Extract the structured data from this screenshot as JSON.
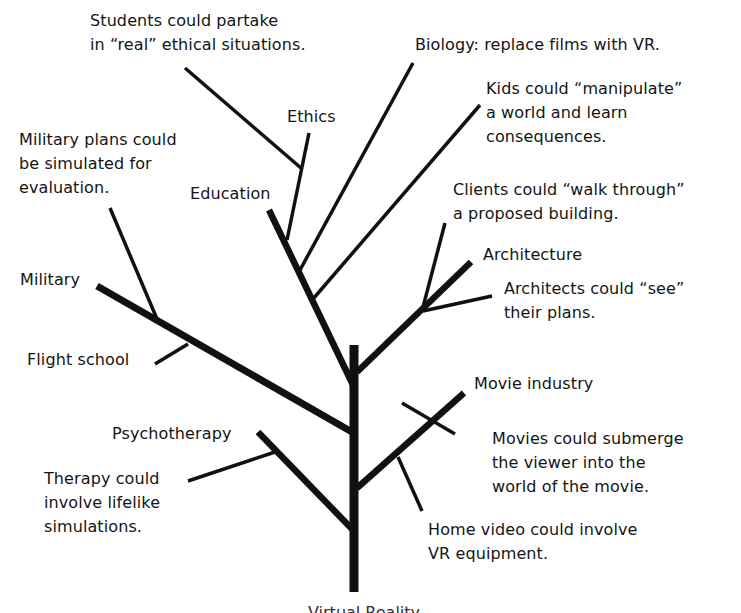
{
  "diagram": {
    "type": "concept-tree",
    "root": {
      "label": "Virtual Reality",
      "note": "root label partially cropped at bottom edge"
    },
    "branches": [
      {
        "id": "military",
        "label": "Military",
        "ideas": [
          "Military plans could\nbe simulated for\nevaluation.",
          "Flight school"
        ]
      },
      {
        "id": "education",
        "label": "Education",
        "ideas": [
          "Students could partake\nin “real” ethical situations.",
          "Biology: replace films with VR.",
          "Kids could “manipulate”\na world and learn\nconsequences."
        ],
        "sub_branches": [
          {
            "id": "ethics",
            "label": "Ethics"
          }
        ]
      },
      {
        "id": "architecture",
        "label": "Architecture",
        "ideas": [
          "Clients could “walk through”\na proposed building.",
          "Architects could “see”\ntheir plans."
        ]
      },
      {
        "id": "movie",
        "label": "Movie industry",
        "ideas": [
          "Movies could submerge\nthe viewer into the\nworld of the movie.",
          "Home video could involve\nVR equipment."
        ]
      },
      {
        "id": "psychotherapy",
        "label": "Psychotherapy",
        "ideas": [
          "Therapy could\ninvolve lifelike\nsimulations."
        ]
      }
    ]
  },
  "labels": {
    "students": "Students could partake\nin “real” ethical situations.",
    "biology": "Biology: replace films with VR.",
    "ethics": "Ethics",
    "kids": "Kids could “manipulate”\na world and learn\nconsequences.",
    "military_plans": "Military plans could\nbe simulated for\nevaluation.",
    "education": "Education",
    "clients": "Clients could “walk through”\na proposed building.",
    "architecture": "Architecture",
    "military": "Military",
    "architects": "Architects could “see”\ntheir plans.",
    "flight_school": "Flight school",
    "movie_industry": "Movie industry",
    "psychotherapy": "Psychotherapy",
    "movies": "Movies could submerge\nthe viewer into the\nworld of the movie.",
    "therapy": "Therapy could\ninvolve lifelike\nsimulations.",
    "home_video": "Home video could involve\nVR equipment.",
    "root": "Virtual Reality"
  },
  "colors": {
    "background": "#ffffff",
    "ink": "#111111"
  }
}
